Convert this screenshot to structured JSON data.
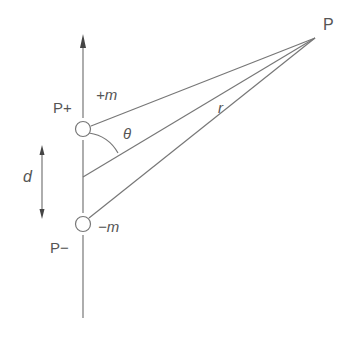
{
  "diagram": {
    "type": "magnetic dipole field point geometry",
    "labels": {
      "point": "P",
      "pole_plus": "P+",
      "pole_minus": "P−",
      "charge_plus": "+m",
      "charge_minus": "−m",
      "distance": "r",
      "angle": "θ",
      "separation": "d"
    },
    "colors": {
      "line": "#777777",
      "text": "#555555",
      "background": "#ffffff"
    }
  }
}
